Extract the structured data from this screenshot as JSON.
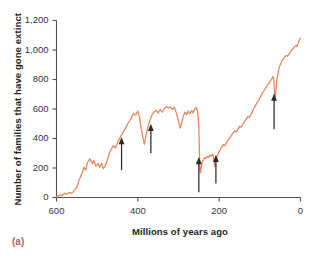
{
  "panel": {
    "label": "(a)"
  },
  "axes": {
    "y_title": "Number of families that have gone extinct",
    "x_title": "Millions of years ago"
  },
  "chart_data": {
    "type": "line",
    "title": "",
    "xlabel": "Millions of years ago",
    "ylabel": "Number of families that have gone extinct",
    "xlim": [
      600,
      0
    ],
    "ylim": [
      0,
      1200
    ],
    "x_reversed": true,
    "grid": false,
    "legend": null,
    "xticks": [
      600,
      400,
      200,
      0
    ],
    "xtick_labels": [
      "600",
      "400",
      "200",
      "0"
    ],
    "yticks": [
      0,
      200,
      400,
      600,
      800,
      1000,
      1200
    ],
    "ytick_labels": [
      "0",
      "200",
      "400",
      "600",
      "800",
      "1,000",
      "1,200"
    ],
    "line_color": "#e8845a",
    "series": [
      {
        "name": "Families gone extinct",
        "points": [
          [
            600,
            5
          ],
          [
            592,
            18
          ],
          [
            586,
            12
          ],
          [
            580,
            30
          ],
          [
            574,
            22
          ],
          [
            568,
            35
          ],
          [
            562,
            30
          ],
          [
            556,
            48
          ],
          [
            550,
            70
          ],
          [
            544,
            120
          ],
          [
            538,
            160
          ],
          [
            532,
            205
          ],
          [
            528,
            185
          ],
          [
            524,
            235
          ],
          [
            518,
            262
          ],
          [
            512,
            230
          ],
          [
            508,
            250
          ],
          [
            503,
            212
          ],
          [
            498,
            230
          ],
          [
            494,
            205
          ],
          [
            489,
            232
          ],
          [
            485,
            196
          ],
          [
            480,
            215
          ],
          [
            475,
            255
          ],
          [
            470,
            300
          ],
          [
            465,
            330
          ],
          [
            460,
            352
          ],
          [
            455,
            335
          ],
          [
            450,
            372
          ],
          [
            445,
            400
          ],
          [
            440,
            425
          ],
          [
            435,
            448
          ],
          [
            430,
            470
          ],
          [
            425,
            500
          ],
          [
            420,
            520
          ],
          [
            415,
            545
          ],
          [
            410,
            570
          ],
          [
            405,
            560
          ],
          [
            400,
            586
          ],
          [
            396,
            545
          ],
          [
            392,
            470
          ],
          [
            388,
            412
          ],
          [
            384,
            360
          ],
          [
            380,
            420
          ],
          [
            376,
            470
          ],
          [
            372,
            510
          ],
          [
            368,
            540
          ],
          [
            364,
            566
          ],
          [
            360,
            580
          ],
          [
            355,
            592
          ],
          [
            350,
            572
          ],
          [
            345,
            598
          ],
          [
            340,
            578
          ],
          [
            335,
            602
          ],
          [
            330,
            618
          ],
          [
            325,
            606
          ],
          [
            320,
            614
          ],
          [
            315,
            596
          ],
          [
            310,
            612
          ],
          [
            305,
            570
          ],
          [
            300,
            520
          ],
          [
            296,
            470
          ],
          [
            292,
            510
          ],
          [
            288,
            552
          ],
          [
            284,
            578
          ],
          [
            280,
            562
          ],
          [
            276,
            586
          ],
          [
            272,
            566
          ],
          [
            268,
            590
          ],
          [
            264,
            574
          ],
          [
            260,
            600
          ],
          [
            257,
            610
          ],
          [
            254,
            596
          ],
          [
            252,
            560
          ],
          [
            250,
            470
          ],
          [
            249,
            360
          ],
          [
            248,
            250
          ],
          [
            247,
            178
          ],
          [
            246,
            168
          ],
          [
            244,
            205
          ],
          [
            241,
            245
          ],
          [
            238,
            258
          ],
          [
            235,
            272
          ],
          [
            232,
            266
          ],
          [
            229,
            280
          ],
          [
            226,
            272
          ],
          [
            223,
            286
          ],
          [
            220,
            280
          ],
          [
            216,
            295
          ],
          [
            213,
            255
          ],
          [
            211,
            212
          ],
          [
            209,
            232
          ],
          [
            206,
            270
          ],
          [
            202,
            300
          ],
          [
            198,
            322
          ],
          [
            194,
            340
          ],
          [
            190,
            358
          ],
          [
            186,
            352
          ],
          [
            182,
            372
          ],
          [
            178,
            390
          ],
          [
            174,
            404
          ],
          [
            170,
            420
          ],
          [
            166,
            438
          ],
          [
            162,
            452
          ],
          [
            158,
            445
          ],
          [
            154,
            462
          ],
          [
            150,
            482
          ],
          [
            146,
            476
          ],
          [
            142,
            498
          ],
          [
            138,
            512
          ],
          [
            134,
            530
          ],
          [
            130,
            548
          ],
          [
            126,
            542
          ],
          [
            122,
            562
          ],
          [
            118,
            585
          ],
          [
            114,
            608
          ],
          [
            110,
            628
          ],
          [
            106,
            646
          ],
          [
            102,
            664
          ],
          [
            98,
            686
          ],
          [
            94,
            706
          ],
          [
            90,
            722
          ],
          [
            86,
            742
          ],
          [
            82,
            758
          ],
          [
            78,
            772
          ],
          [
            74,
            790
          ],
          [
            70,
            806
          ],
          [
            68,
            820
          ],
          [
            66,
            810
          ],
          [
            65,
            770
          ],
          [
            64,
            712
          ],
          [
            63,
            660
          ],
          [
            62,
            690
          ],
          [
            60,
            740
          ],
          [
            58,
            800
          ],
          [
            55,
            852
          ],
          [
            52,
            886
          ],
          [
            48,
            912
          ],
          [
            44,
            934
          ],
          [
            40,
            948
          ],
          [
            36,
            962
          ],
          [
            32,
            958
          ],
          [
            28,
            974
          ],
          [
            24,
            990
          ],
          [
            20,
            1002
          ],
          [
            16,
            1018
          ],
          [
            12,
            1030
          ],
          [
            9,
            1024
          ],
          [
            6,
            1042
          ],
          [
            3,
            1068
          ],
          [
            1,
            1078
          ],
          [
            0,
            1080
          ]
        ]
      }
    ],
    "annotations": [
      {
        "name": "mass-extinction-arrow",
        "x": 440,
        "y_tip": 410,
        "y_tail": 185,
        "label": ""
      },
      {
        "name": "mass-extinction-arrow",
        "x": 368,
        "y_tip": 500,
        "y_tail": 300,
        "label": ""
      },
      {
        "name": "mass-extinction-arrow",
        "x": 250,
        "y_tip": 275,
        "y_tail": 35,
        "label": ""
      },
      {
        "name": "mass-extinction-arrow",
        "x": 208,
        "y_tip": 290,
        "y_tail": 95,
        "label": ""
      },
      {
        "name": "mass-extinction-arrow",
        "x": 65,
        "y_tip": 705,
        "y_tail": 462,
        "label": ""
      }
    ]
  }
}
